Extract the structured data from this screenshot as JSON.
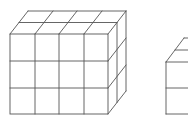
{
  "diagram": {
    "stroke_color": "#555555",
    "background": "#ffffff",
    "shapes": [
      {
        "name": "large-cube-stack",
        "columns": 4,
        "rows": 3,
        "depth": 2,
        "fully_visible": true
      },
      {
        "name": "small-cube-stack",
        "rows": 2,
        "depth": 2,
        "fully_visible": false,
        "note": "cropped at right edge"
      }
    ]
  }
}
